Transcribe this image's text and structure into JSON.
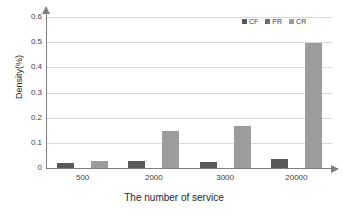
{
  "chart_data": {
    "type": "bar",
    "title": "",
    "xlabel": "The number of service",
    "ylabel": "Density(%)",
    "categories": [
      "500",
      "2000",
      "3000",
      "20000"
    ],
    "series": [
      {
        "name": "CF",
        "color": "#595959",
        "values": [
          0.018,
          0.026,
          0.024,
          0.034
        ]
      },
      {
        "name": "PR",
        "color": "#6e6e6e",
        "values": [
          0.0,
          0.0,
          0.0,
          0.0
        ]
      },
      {
        "name": "CR",
        "color": "#9c9c9c",
        "values": [
          0.028,
          0.148,
          0.167,
          0.497
        ]
      }
    ],
    "ylim": [
      0,
      0.6
    ],
    "yticks": [
      "0",
      "0.1",
      "0.2",
      "0.3",
      "0.4",
      "0.5",
      "0.6"
    ],
    "ytick_values": [
      0,
      0.1,
      0.2,
      0.3,
      0.4,
      0.5,
      0.6
    ],
    "grid": true,
    "legend_position": "top-right"
  },
  "legend": {
    "items": [
      {
        "label": "CF",
        "color": "#595959"
      },
      {
        "label": "PR",
        "color": "#6e6e6e"
      },
      {
        "label": "CR",
        "color": "#9c9c9c"
      }
    ]
  },
  "axes": {
    "y_title": "Density(%)",
    "x_title": "The number of service"
  },
  "colors": {
    "grid": "#d9d9d9",
    "axis": "#7f7f7f",
    "text": "#404040",
    "background": "#ffffff"
  }
}
